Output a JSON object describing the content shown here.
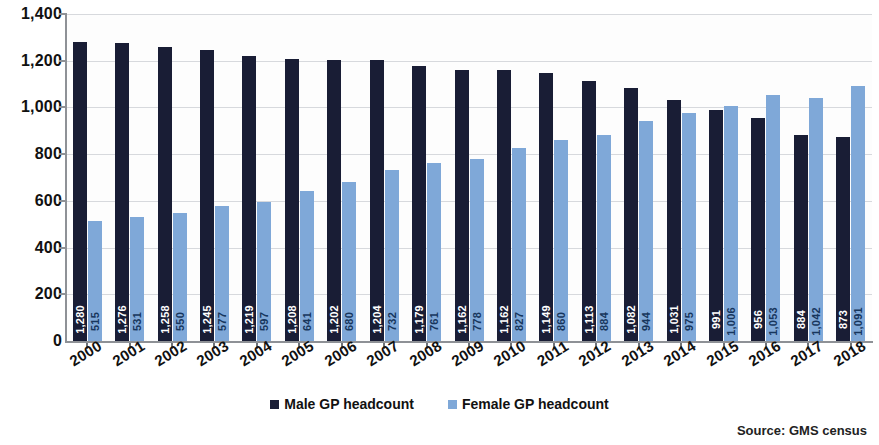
{
  "chart_data": {
    "type": "bar",
    "title": "",
    "xlabel": "",
    "ylabel": "",
    "ylim": [
      0,
      1400
    ],
    "grid": true,
    "legend_position": "bottom-center",
    "y_ticks": [
      "0",
      "200",
      "400",
      "600",
      "800",
      "1,000",
      "1,200",
      "1,400"
    ],
    "y_tick_values": [
      0,
      200,
      400,
      600,
      800,
      1000,
      1200,
      1400
    ],
    "categories": [
      "2000",
      "2001",
      "2002",
      "2003",
      "2004",
      "2005",
      "2006",
      "2007",
      "2008",
      "2009",
      "2010",
      "2011",
      "2012",
      "2013",
      "2014",
      "2015",
      "2016",
      "2017",
      "2018"
    ],
    "series": [
      {
        "name": "Male GP headcount",
        "color": "#191d35",
        "values": [
          1280,
          1276,
          1258,
          1245,
          1219,
          1208,
          1202,
          1204,
          1179,
          1162,
          1162,
          1149,
          1113,
          1082,
          1031,
          991,
          956,
          884,
          873
        ],
        "labels": [
          "1,280",
          "1,276",
          "1,258",
          "1,245",
          "1,219",
          "1,208",
          "1,202",
          "1,204",
          "1,179",
          "1,162",
          "1,162",
          "1,149",
          "1,113",
          "1,082",
          "1,031",
          "991",
          "956",
          "884",
          "873"
        ]
      },
      {
        "name": "Female GP headcount",
        "color": "#7fa8d8",
        "values": [
          515,
          531,
          550,
          577,
          597,
          641,
          680,
          732,
          761,
          778,
          827,
          860,
          884,
          944,
          975,
          1006,
          1053,
          1042,
          1091
        ],
        "labels": [
          "515",
          "531",
          "550",
          "577",
          "597",
          "641",
          "680",
          "732",
          "761",
          "778",
          "827",
          "860",
          "884",
          "944",
          "975",
          "1,006",
          "1,053",
          "1,042",
          "1,091"
        ]
      }
    ]
  },
  "legend": {
    "items": [
      {
        "label": "Male GP headcount",
        "key": "male"
      },
      {
        "label": "Female GP headcount",
        "key": "female"
      }
    ]
  },
  "source": {
    "text": "Source: GMS census"
  }
}
